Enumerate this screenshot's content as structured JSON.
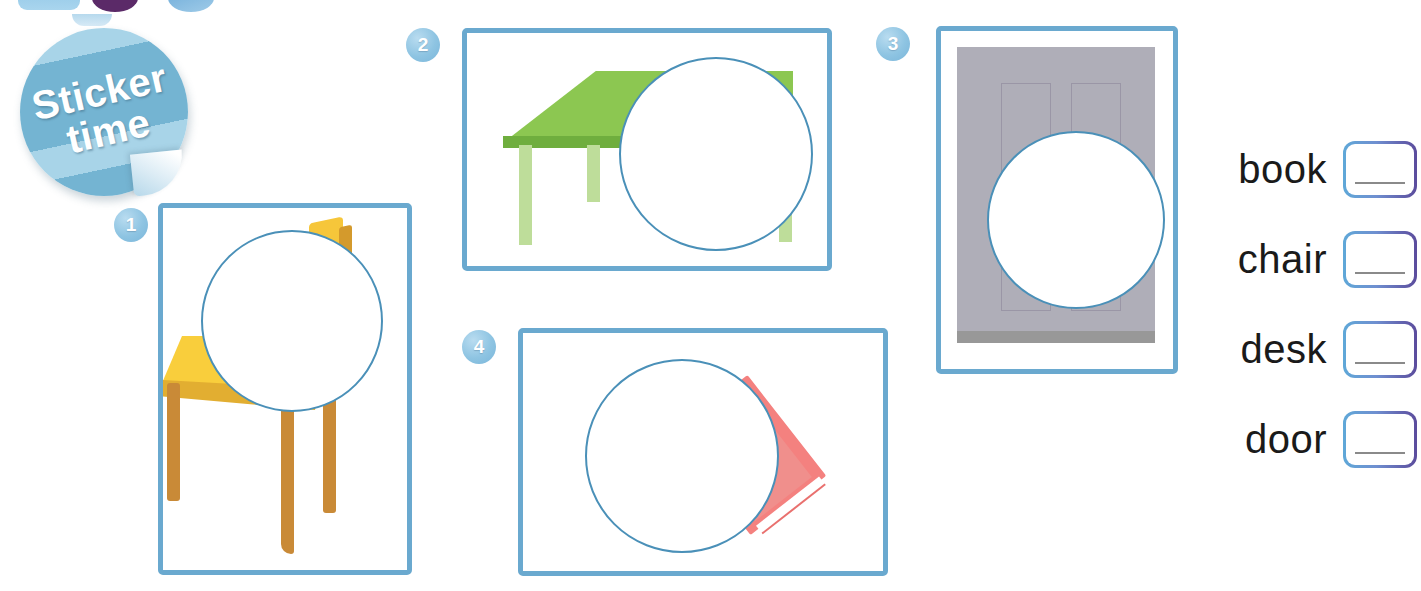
{
  "page": {
    "type": "worksheet",
    "activity": "sticker-matching"
  },
  "sticker_badge": {
    "line1": "Sticker",
    "line2": "time",
    "color": "#74b4d2"
  },
  "header_crop": {
    "chip_rounded": "",
    "chip_purple": "",
    "chip_blue": ""
  },
  "panels": [
    {
      "number": "1",
      "subject": "chair",
      "orientation": "portrait",
      "colors": {
        "main": "#f9ce3c",
        "shadow": "#e2ae31",
        "legs": "#c98a37"
      }
    },
    {
      "number": "2",
      "subject": "desk",
      "orientation": "landscape",
      "colors": {
        "main": "#8cc751",
        "shadow": "#6fae3e",
        "legs": "#bedd9a"
      }
    },
    {
      "number": "3",
      "subject": "door",
      "orientation": "portrait",
      "colors": {
        "main": "#afaeb8",
        "shadow": "#9a96a6",
        "sill": "#989898"
      }
    },
    {
      "number": "4",
      "subject": "book",
      "orientation": "landscape",
      "colors": {
        "main": "#f4817f",
        "shadow": "#f08f8c",
        "pages": "#ffffff"
      }
    }
  ],
  "word_list": {
    "items": [
      {
        "label": "book"
      },
      {
        "label": "chair"
      },
      {
        "label": "desk"
      },
      {
        "label": "door"
      }
    ]
  },
  "colors": {
    "frame_border": "#6aa9cf",
    "badge": "#8ec4e2",
    "circle_outline": "#4a90b8",
    "box_gradient_start": "#5fa8d8",
    "box_gradient_end": "#5b4b9c",
    "write_line": "#8a8a8a"
  }
}
